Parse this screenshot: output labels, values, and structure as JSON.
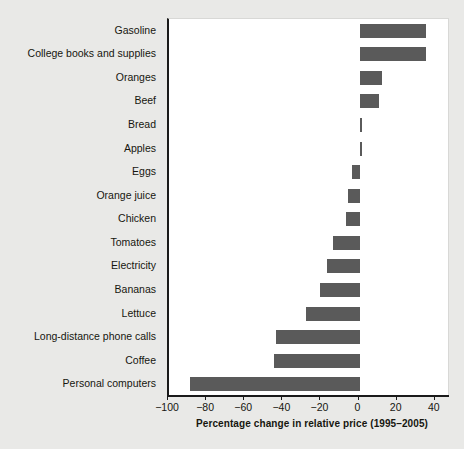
{
  "chart_data": {
    "type": "bar",
    "orientation": "horizontal",
    "title": "",
    "xlabel": "Percentage change in relative price (1995–2005)",
    "ylabel": "",
    "xlim": [
      -100,
      48
    ],
    "xticks": [
      -100,
      -80,
      -60,
      -40,
      -20,
      0,
      20,
      40
    ],
    "xticklabels": [
      "−100",
      "−80",
      "−60",
      "−40",
      "−20",
      "0",
      "20",
      "40"
    ],
    "grid": false,
    "legend": null,
    "bar_color": "#5a5a5a",
    "plot_background": "#ffffff",
    "page_background": "#e9e9e7",
    "categories": [
      "Gasoline",
      "College books and supplies",
      "Oranges",
      "Beef",
      "Bread",
      "Apples",
      "Eggs",
      "Orange juice",
      "Chicken",
      "Tomatoes",
      "Electricity",
      "Bananas",
      "Lettuce",
      "Long-distance phone calls",
      "Coffee",
      "Personal computers"
    ],
    "values": [
      35,
      35,
      12,
      10,
      1.5,
      0.5,
      -4,
      -6,
      -7,
      -14,
      -17,
      -21,
      -28,
      -44,
      -45,
      -89
    ]
  }
}
